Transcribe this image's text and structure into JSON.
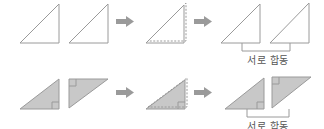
{
  "diagram": {
    "rows": [
      {
        "id": "outline",
        "style": "outline",
        "steps": [
          "two-triangles",
          "overlapped",
          "congruent-pair"
        ],
        "label": "서로 합동"
      },
      {
        "id": "shaded",
        "style": "filled-with-right-angle-marks",
        "steps": [
          "two-triangles",
          "overlapped",
          "congruent-pair"
        ],
        "label": "서로 합동"
      }
    ],
    "arrow_icon": "right-arrow-icon"
  },
  "colors": {
    "stroke": "#9a9a9a",
    "fill": "#c8c8c8",
    "arrow": "#9a9a9a",
    "bracket": "#9a9a9a",
    "text": "#555555"
  }
}
